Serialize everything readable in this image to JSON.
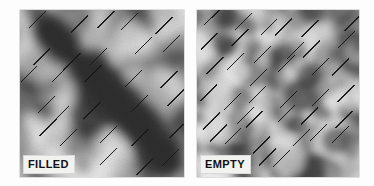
{
  "figure": {
    "name": "contour-integration-stimulus-figure",
    "background_color": "#fdfdfd",
    "width": 374,
    "height": 186,
    "panel_count": 2
  },
  "panels": [
    {
      "id": "filled",
      "label": "FILLED",
      "label_background": "#f2f2f0",
      "label_color": "#101010",
      "x": 20,
      "y": 10,
      "width": 164,
      "height": 167,
      "texture": {
        "type": "grayscale-blob-noise",
        "description": "Low-pass grayscale noise containing a dark diagonal band running from upper-left to lower-right",
        "mean_gray": "#b4b4b4",
        "dark_gray": "#2e2e2e",
        "light_gray": "#f0f0f0",
        "band_present": true,
        "band_orientation_deg": -45,
        "blob_scale_px": 26
      },
      "elements": {
        "type": "oriented-line-segments",
        "orientation_deg": -45,
        "count": 30,
        "length_px": 24,
        "color": "#1a1a1a",
        "stroke_px": 1.1
      }
    },
    {
      "id": "empty",
      "label": "EMPTY",
      "label_background": "#f2f2f0",
      "label_color": "#101010",
      "x": 197,
      "y": 10,
      "width": 162,
      "height": 167,
      "texture": {
        "type": "grayscale-blob-noise",
        "description": "Low-pass grayscale noise with no coherent diagonal band, finer and more uniform blobs",
        "mean_gray": "#b4b4b4",
        "dark_gray": "#3a3a3a",
        "light_gray": "#f2f2f2",
        "band_present": false,
        "band_orientation_deg": null,
        "blob_scale_px": 19
      },
      "elements": {
        "type": "oriented-line-segments",
        "orientation_deg": -45,
        "count": 40,
        "length_px": 24,
        "color": "#1a1a1a",
        "stroke_px": 1.1
      }
    }
  ]
}
